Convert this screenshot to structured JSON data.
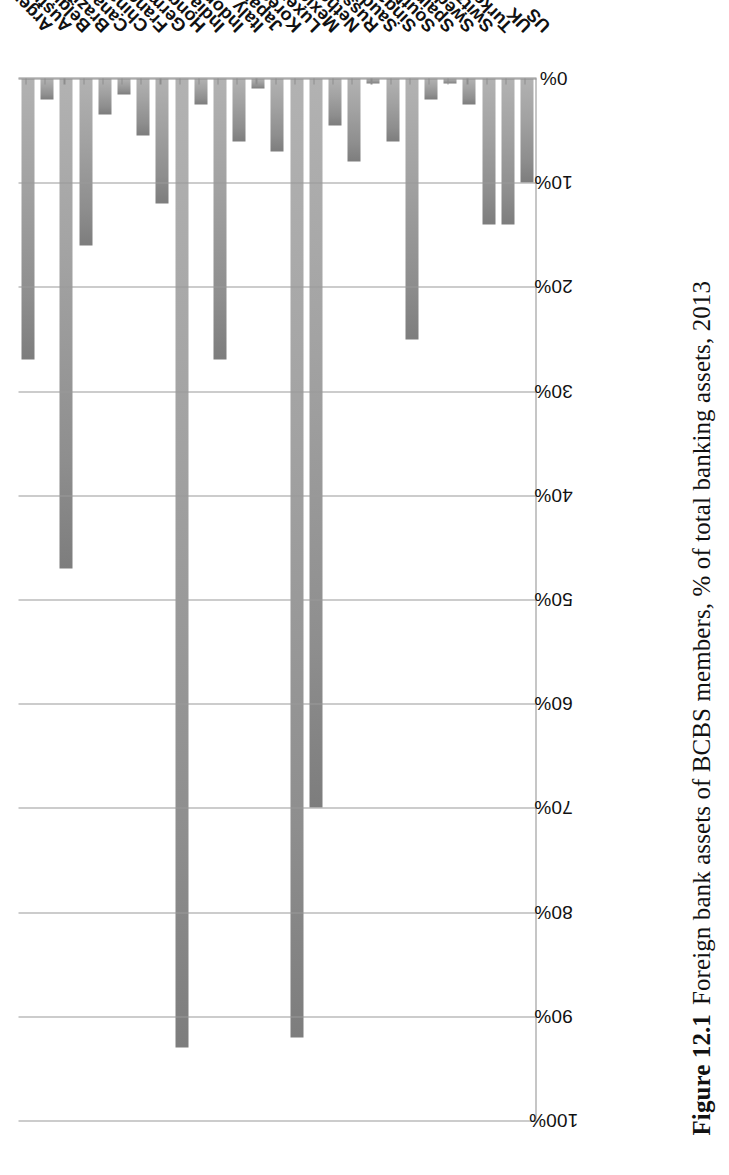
{
  "figure": {
    "number": "Figure 12.1",
    "caption": "Foreign bank assets of BCBS members, % of total banking assets, 2013"
  },
  "chart_data": {
    "type": "bar",
    "orientation": "vertical-scanned-sideways",
    "title": "Foreign bank assets of BCBS members, % of total banking assets, 2013",
    "xlabel": "",
    "ylabel": "",
    "ylim": [
      0,
      100
    ],
    "ytick_labels": [
      "0%",
      "10%",
      "20%",
      "30%",
      "40%",
      "50%",
      "60%",
      "70%",
      "80%",
      "90%",
      "100%"
    ],
    "ytick_values": [
      0,
      10,
      20,
      30,
      40,
      50,
      60,
      70,
      80,
      90,
      100
    ],
    "grid": true,
    "legend": false,
    "bar_color": "#9a9a9a",
    "categories": [
      "Argentina",
      "Australia",
      "Belgium",
      "Brazil",
      "Canada",
      "China",
      "France",
      "Germany",
      "Hong Kong",
      "India",
      "Indonesia",
      "Italy",
      "Japan",
      "Korea",
      "Luxembourg",
      "Mexico",
      "Netherlands",
      "Russia",
      "Saudi Arabia",
      "Singapore",
      "South Africa",
      "Spain",
      "Sweden",
      "Switzerland",
      "Turkey",
      "UK",
      "US"
    ],
    "values": [
      27,
      2,
      47,
      16,
      3.5,
      1.5,
      5.5,
      12,
      93,
      2.5,
      27,
      6,
      1,
      7,
      92,
      70,
      4.5,
      8,
      0.5,
      6,
      25,
      2,
      0.5,
      2.5,
      14,
      14,
      10
    ],
    "series": [
      {
        "name": "Foreign bank assets (% of total banking assets)",
        "values": [
          27,
          2,
          47,
          16,
          3.5,
          1.5,
          5.5,
          12,
          93,
          2.5,
          27,
          6,
          1,
          7,
          92,
          70,
          4.5,
          8,
          0.5,
          6,
          25,
          2,
          0.5,
          2.5,
          14,
          14,
          10
        ]
      }
    ]
  }
}
